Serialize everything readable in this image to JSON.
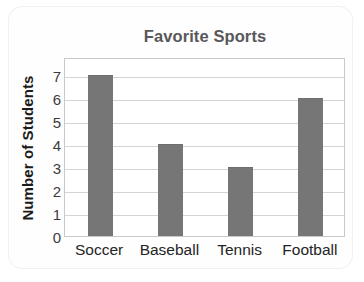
{
  "chart_data": {
    "type": "bar",
    "title": "Favorite Sports",
    "xlabel": "",
    "ylabel": "Number of Students",
    "categories": [
      "Soccer",
      "Baseball",
      "Tennis",
      "Football"
    ],
    "values": [
      7,
      4,
      3,
      6
    ],
    "ylim": [
      0,
      7.8
    ],
    "yticks": [
      0,
      1,
      2,
      3,
      4,
      5,
      6,
      7
    ],
    "ytick_labels": [
      "0",
      "1",
      "2",
      "3",
      "4",
      "5",
      "6",
      "7"
    ],
    "grid": true,
    "grid_axis": "y",
    "legend": false,
    "legend_position": "none",
    "bar_color": "#767676",
    "grid_color": "#d4d4d4",
    "frame_color": "#c9c9c9",
    "title_color": "#58585a",
    "axis_label_color": "#1b1b1b",
    "tick_label_color": "#3c3c3c"
  }
}
